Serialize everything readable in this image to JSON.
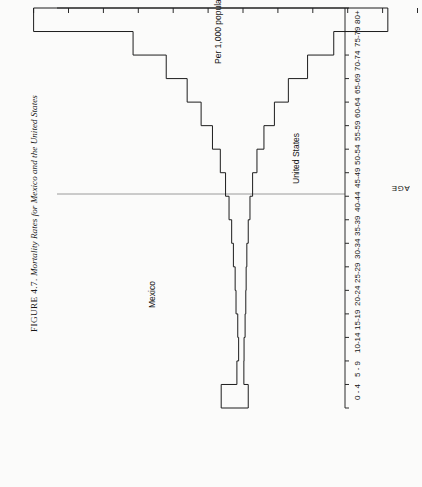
{
  "figure": {
    "label": "FIGURE 4.7.",
    "caption": "Mortality Rates for Mexico and the United States"
  },
  "chart_data": {
    "type": "bar",
    "orientation": "horizontal-back-to-back",
    "title": "Mortality Rates for Mexico and the United States",
    "xlabel": "Per 1,000 population",
    "ylabel": "AGE",
    "categories": [
      "80+",
      "75-79",
      "70-74",
      "65-69",
      "60-64",
      "55-59",
      "50-54",
      "45-49",
      "40-44",
      "35-39",
      "30-34",
      "25-29",
      "20-24",
      "15-19",
      "10-14",
      "5 - 9",
      "0 - 4"
    ],
    "value_ticks_left": [
      120,
      100,
      80,
      60,
      40,
      20,
      0
    ],
    "value_ticks_right": [
      0,
      20,
      40,
      60,
      80,
      100
    ],
    "value_axis_min": -120,
    "value_axis_max": 100,
    "grid": false,
    "legend_position": "inside-panel",
    "series": [
      {
        "name": "Mexico",
        "direction": "left",
        "values": [
          120.0,
          63.0,
          44.0,
          32.0,
          24.0,
          17.5,
          13.0,
          10.0,
          8.0,
          6.5,
          5.5,
          4.5,
          4.0,
          3.0,
          2.5,
          3.5,
          12.5
        ]
      },
      {
        "name": "United States",
        "direction": "right",
        "values": [
          83.0,
          52.0,
          37.0,
          26.0,
          18.0,
          12.0,
          8.0,
          5.5,
          4.0,
          3.0,
          2.2,
          1.8,
          1.6,
          1.2,
          0.6,
          0.5,
          3.0
        ]
      }
    ],
    "annotations": [
      {
        "text": "United States",
        "series": "United States"
      },
      {
        "text": "Mexico",
        "series": "Mexico"
      }
    ]
  }
}
